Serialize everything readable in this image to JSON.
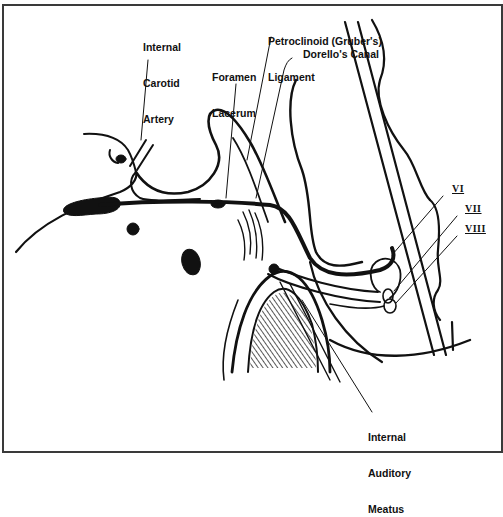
{
  "figure": {
    "type": "anatomical line drawing",
    "border_color": "#3a3a3a",
    "ink_color": "#111111"
  },
  "labels": {
    "internal_carotid_artery": {
      "line1": "Internal",
      "line2": "Carotid",
      "line3": "Artery"
    },
    "foramen_lacerum": {
      "line1": "Foramen",
      "line2": "Lacerum"
    },
    "petroclinoid_ligament": {
      "line1": "Petroclinoid (Gruber's)",
      "line2": "Ligament"
    },
    "dorellos_canal": "Dorello's Canal",
    "internal_auditory_meatus": {
      "line1": "Internal",
      "line2": "Auditory",
      "line3": "Meatus"
    },
    "cranial_nerves": [
      "VI",
      "VII",
      "VIII"
    ]
  }
}
